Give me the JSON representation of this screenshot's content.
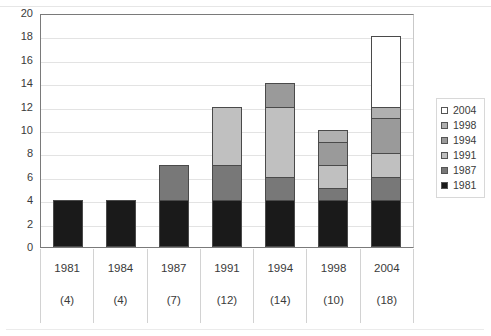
{
  "chart_data": {
    "type": "bar",
    "stacked": true,
    "title": "",
    "subtitle": "",
    "xlabel": "",
    "ylabel": "",
    "ylim": [
      0,
      20
    ],
    "ytick_step": 2,
    "yticks": [
      "20",
      "18",
      "16",
      "14",
      "12",
      "10",
      "8",
      "6",
      "4",
      "2",
      "0"
    ],
    "grid": true,
    "legend_position": "right",
    "categories": [
      "1981",
      "1984",
      "1987",
      "1991",
      "1994",
      "1998",
      "2004"
    ],
    "category_totals": [
      "(4)",
      "(4)",
      "(7)",
      "(12)",
      "(14)",
      "(10)",
      "(18)"
    ],
    "totals": [
      4,
      4,
      7,
      12,
      14,
      10,
      18
    ],
    "series": [
      {
        "name": "1981",
        "color": "#1a1a1a",
        "values": [
          4,
          4,
          4,
          4,
          4,
          4,
          4
        ]
      },
      {
        "name": "1987",
        "color": "#787878",
        "values": [
          0,
          0,
          3,
          3,
          2,
          1,
          2
        ]
      },
      {
        "name": "1991",
        "color": "#c0c0c0",
        "values": [
          0,
          0,
          0,
          5,
          6,
          2,
          2
        ]
      },
      {
        "name": "1994",
        "color": "#9a9a9a",
        "values": [
          0,
          0,
          0,
          0,
          2,
          2,
          3
        ]
      },
      {
        "name": "1998",
        "color": "#b0b0b0",
        "values": [
          0,
          0,
          0,
          0,
          0,
          1,
          1
        ]
      },
      {
        "name": "2004",
        "color": "#ffffff",
        "values": [
          0,
          0,
          0,
          0,
          0,
          0,
          6
        ]
      }
    ],
    "legend_entries": [
      {
        "label": "2004",
        "color": "#ffffff"
      },
      {
        "label": "1998",
        "color": "#b0b0b0"
      },
      {
        "label": "1994",
        "color": "#9a9a9a"
      },
      {
        "label": "1991",
        "color": "#c0c0c0"
      },
      {
        "label": "1987",
        "color": "#787878"
      },
      {
        "label": "1981",
        "color": "#1a1a1a"
      }
    ]
  }
}
